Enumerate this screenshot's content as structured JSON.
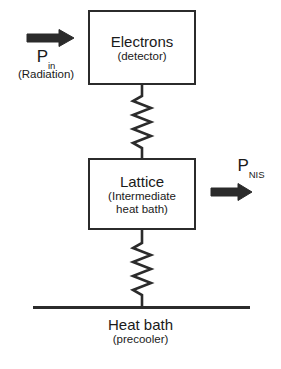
{
  "diagram": {
    "stroke_color": "#2b2b2b",
    "background_color": "#ffffff",
    "blocks": [
      {
        "id": "electrons",
        "title": "Electrons",
        "subtitle": "(detector)"
      },
      {
        "id": "lattice",
        "title": "Lattice",
        "subtitle_line1": "(Intermediate",
        "subtitle_line2": "heat bath)"
      }
    ],
    "base": {
      "title": "Heat bath",
      "subtitle": "(precooler)"
    },
    "power_in": {
      "symbol": "P",
      "subscript": "in",
      "note": "(Radiation)",
      "arrow_direction": "right",
      "arrow_icon": "arrow-right-icon"
    },
    "power_out": {
      "symbol": "P",
      "subscript": "NIS",
      "note": "",
      "arrow_direction": "right",
      "arrow_icon": "arrow-right-icon"
    },
    "couplings": [
      {
        "id": "electrons-lattice",
        "icon": "spring-icon"
      },
      {
        "id": "lattice-heatbath",
        "icon": "spring-icon"
      }
    ]
  }
}
